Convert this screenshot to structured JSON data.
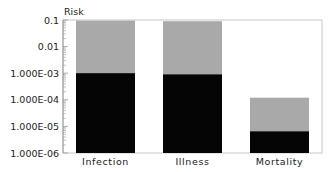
{
  "chart_data": {
    "type": "bar",
    "stacked": true,
    "yscale": "log",
    "title": "",
    "xlabel": "",
    "ylabel": "Risk",
    "ylim": [
      1e-06,
      0.1
    ],
    "yticks": [
      0.1,
      0.01,
      0.001,
      0.0001,
      1e-05,
      1e-06
    ],
    "ytick_labels": [
      "0.1",
      "0.01",
      "1.000E-03",
      "1.000E-04",
      "1.000E-05",
      "1.000E-06"
    ],
    "categories": [
      "Infection",
      "Illness",
      "Mortality"
    ],
    "series": [
      {
        "name": "lower",
        "color": "#050505",
        "values": [
          0.001,
          0.0009,
          6.5e-06
        ]
      },
      {
        "name": "upper",
        "color": "#a9a9a9",
        "values": [
          0.095,
          0.09,
          0.00012
        ]
      }
    ],
    "grid": false,
    "legend": "none"
  },
  "colors": {
    "frame": "#c8c8c8",
    "axis": "#9a9a9a",
    "text": "#222222",
    "background": "#ffffff"
  }
}
